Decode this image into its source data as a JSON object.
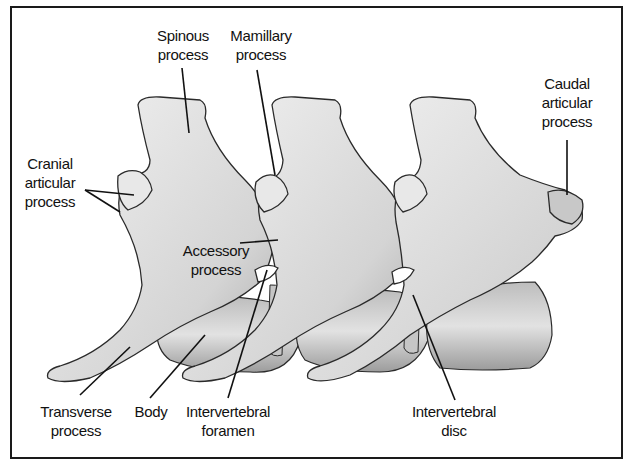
{
  "diagram": {
    "labels": {
      "spinous_process": "Spinous\nprocess",
      "mamillary_process": "Mamillary\nprocess",
      "caudal_articular_process": "Caudal\narticular\nprocess",
      "cranial_articular_process": "Cranial\narticular\nprocess",
      "accessory_process": "Accessory\nprocess",
      "transverse_process": "Transverse\nprocess",
      "body": "Body",
      "intervertebral_foramen": "Intervertebral\nforamen",
      "intervertebral_disc": "Intervertebral\ndisc"
    },
    "colors": {
      "border": "#1a1a1a",
      "bone_light": "#f4f4f4",
      "bone_mid": "#cfcfcf",
      "bone_dark": "#9a9a9a",
      "outline": "#2a2a2a",
      "leader": "#111111"
    }
  }
}
